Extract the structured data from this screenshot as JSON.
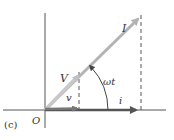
{
  "figure": {
    "panel_label": "(c)",
    "origin_label": "O",
    "phasors": {
      "current_amplitude": {
        "label": "I",
        "color": "#b3b3b3"
      },
      "voltage_amplitude": {
        "label": "V",
        "color": "#c0c0c0"
      },
      "current_instant": {
        "label": "i",
        "color": "#555555"
      },
      "voltage_instant": {
        "label": "v",
        "color": "#777777"
      }
    },
    "angle_label": "ωt",
    "axis_color": "#555555",
    "dash_color": "#444444"
  }
}
